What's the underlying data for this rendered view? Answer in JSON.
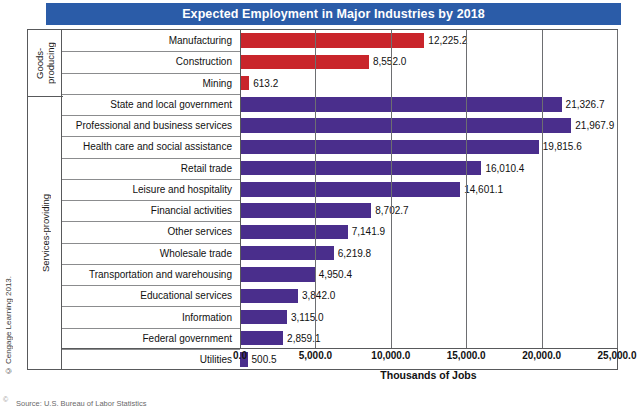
{
  "chart": {
    "title": "Expected Employment in Major Industries by 2018",
    "title_bar_color": "#2B5CA8",
    "axis_title": "Thousands of Jobs",
    "credit": "© Cengage Learning 2013.",
    "source_note": "Source: U.S. Bureau of Labor Statistics",
    "groups": [
      {
        "name": "goods",
        "label": "Goods-\nproducing"
      },
      {
        "name": "services",
        "label": "Services-providing"
      }
    ]
  },
  "chart_data": {
    "type": "bar",
    "orientation": "horizontal",
    "title": "Expected Employment in Major Industries by 2018",
    "xlabel": "Thousands of Jobs",
    "ylabel": "",
    "xlim": [
      0,
      25000
    ],
    "xticks": [
      "0.0",
      "5,000.0",
      "10,000.0",
      "15,000.0",
      "20,000.0",
      "25,000.0"
    ],
    "xtick_values": [
      0,
      5000,
      10000,
      15000,
      20000,
      25000
    ],
    "grid": true,
    "legend": "none",
    "colors": {
      "goods-producing": "#C9252B",
      "services-providing": "#4A2E8C"
    },
    "categories": [
      "Manufacturing",
      "Construction",
      "Mining",
      "State and local government",
      "Professional and business services",
      "Health care and social assistance",
      "Retail trade",
      "Leisure and hospitality",
      "Financial activities",
      "Other services",
      "Wholesale trade",
      "Transportation and warehousing",
      "Educational services",
      "Information",
      "Federal government",
      "Utilities"
    ],
    "values": [
      12225.2,
      8552.0,
      613.2,
      21326.7,
      21967.9,
      19815.6,
      16010.4,
      14601.1,
      8702.7,
      7141.9,
      6219.8,
      4950.4,
      3842.0,
      3115.0,
      2859.1,
      500.5
    ],
    "data_labels": [
      "12,225.2",
      "8,552.0",
      "613.2",
      "21,326.7",
      "21,967.9",
      "19,815.6",
      "16,010.4",
      "14,601.1",
      "8,702.7",
      "7,141.9",
      "6,219.8",
      "4,950.4",
      "3,842.0",
      "3,115.0",
      "2,859.1",
      "500.5"
    ],
    "group_of": [
      "goods-producing",
      "goods-producing",
      "goods-producing",
      "services-providing",
      "services-providing",
      "services-providing",
      "services-providing",
      "services-providing",
      "services-providing",
      "services-providing",
      "services-providing",
      "services-providing",
      "services-providing",
      "services-providing",
      "services-providing",
      "services-providing"
    ]
  }
}
